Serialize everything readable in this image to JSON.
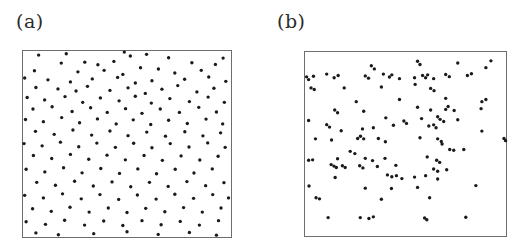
{
  "figure": {
    "width": 523,
    "height": 249,
    "background": "#ffffff",
    "dot_color": "#1a1a1a",
    "frame_color": "#6d6d6d",
    "label_color": "#2b2b2b"
  },
  "panels": [
    {
      "id": "panel-a",
      "label": "(a)",
      "label_x": 16,
      "label_y": 12,
      "box": {
        "x": 22,
        "y": 50,
        "width": 210,
        "height": 188
      }
    },
    {
      "id": "panel-b",
      "label": "(b)",
      "label_x": 277,
      "label_y": 12,
      "box": {
        "x": 304,
        "y": 51,
        "width": 203,
        "height": 186
      }
    }
  ],
  "chart_data": [
    {
      "type": "scatter",
      "title": "(a)",
      "xlabel": "",
      "ylabel": "",
      "xlim": [
        0,
        1
      ],
      "ylim": [
        0,
        1
      ],
      "grid": false,
      "legend": null,
      "marker": {
        "shape": "circle",
        "size_px": 3.4,
        "color": "#1a1a1a"
      },
      "description": "Complete spatial randomness (Poisson) point pattern",
      "n_points": 130,
      "points": [
        [
          0.075,
          0.022
        ],
        [
          0.208,
          0.015
        ],
        [
          0.487,
          0.006
        ],
        [
          0.516,
          0.027
        ],
        [
          0.594,
          0.018
        ],
        [
          0.7,
          0.036
        ],
        [
          0.962,
          0.038
        ],
        [
          0.184,
          0.065
        ],
        [
          0.297,
          0.06
        ],
        [
          0.36,
          0.074
        ],
        [
          0.437,
          0.056
        ],
        [
          0.565,
          0.09
        ],
        [
          0.812,
          0.063
        ],
        [
          0.925,
          0.072
        ],
        [
          0.055,
          0.106
        ],
        [
          0.264,
          0.112
        ],
        [
          0.39,
          0.104
        ],
        [
          0.48,
          0.126
        ],
        [
          0.651,
          0.097
        ],
        [
          0.73,
          0.118
        ],
        [
          0.857,
          0.104
        ],
        [
          0.008,
          0.145
        ],
        [
          0.12,
          0.155
        ],
        [
          0.228,
          0.166
        ],
        [
          0.333,
          0.15
        ],
        [
          0.455,
          0.142
        ],
        [
          0.54,
          0.172
        ],
        [
          0.62,
          0.16
        ],
        [
          0.777,
          0.152
        ],
        [
          0.893,
          0.14
        ],
        [
          0.975,
          0.163
        ],
        [
          0.062,
          0.196
        ],
        [
          0.168,
          0.204
        ],
        [
          0.255,
          0.215
        ],
        [
          0.31,
          0.19
        ],
        [
          0.418,
          0.212
        ],
        [
          0.505,
          0.198
        ],
        [
          0.588,
          0.228
        ],
        [
          0.668,
          0.205
        ],
        [
          0.744,
          0.186
        ],
        [
          0.836,
          0.22
        ],
        [
          0.918,
          0.2
        ],
        [
          0.02,
          0.25
        ],
        [
          0.104,
          0.263
        ],
        [
          0.202,
          0.245
        ],
        [
          0.287,
          0.276
        ],
        [
          0.372,
          0.252
        ],
        [
          0.462,
          0.268
        ],
        [
          0.54,
          0.243
        ],
        [
          0.617,
          0.28
        ],
        [
          0.706,
          0.256
        ],
        [
          0.8,
          0.272
        ],
        [
          0.89,
          0.248
        ],
        [
          0.968,
          0.276
        ],
        [
          0.048,
          0.312
        ],
        [
          0.14,
          0.3
        ],
        [
          0.236,
          0.325
        ],
        [
          0.325,
          0.305
        ],
        [
          0.405,
          0.33
        ],
        [
          0.493,
          0.31
        ],
        [
          0.572,
          0.335
        ],
        [
          0.66,
          0.312
        ],
        [
          0.752,
          0.33
        ],
        [
          0.845,
          0.303
        ],
        [
          0.93,
          0.328
        ],
        [
          0.012,
          0.368
        ],
        [
          0.098,
          0.38
        ],
        [
          0.186,
          0.358
        ],
        [
          0.272,
          0.386
        ],
        [
          0.358,
          0.365
        ],
        [
          0.448,
          0.392
        ],
        [
          0.53,
          0.37
        ],
        [
          0.614,
          0.395
        ],
        [
          0.7,
          0.372
        ],
        [
          0.79,
          0.39
        ],
        [
          0.88,
          0.366
        ],
        [
          0.96,
          0.392
        ],
        [
          0.06,
          0.432
        ],
        [
          0.15,
          0.448
        ],
        [
          0.24,
          0.425
        ],
        [
          0.33,
          0.452
        ],
        [
          0.418,
          0.43
        ],
        [
          0.505,
          0.455
        ],
        [
          0.595,
          0.436
        ],
        [
          0.685,
          0.458
        ],
        [
          0.778,
          0.434
        ],
        [
          0.865,
          0.456
        ],
        [
          0.95,
          0.44
        ],
        [
          0.005,
          0.498
        ],
        [
          0.092,
          0.51
        ],
        [
          0.18,
          0.49
        ],
        [
          0.268,
          0.515
        ],
        [
          0.355,
          0.495
        ],
        [
          0.444,
          0.518
        ],
        [
          0.532,
          0.496
        ],
        [
          0.62,
          0.52
        ],
        [
          0.708,
          0.498
        ],
        [
          0.798,
          0.516
        ],
        [
          0.888,
          0.494
        ],
        [
          0.972,
          0.518
        ],
        [
          0.05,
          0.562
        ],
        [
          0.138,
          0.578
        ],
        [
          0.228,
          0.556
        ],
        [
          0.316,
          0.582
        ],
        [
          0.404,
          0.56
        ],
        [
          0.492,
          0.585
        ],
        [
          0.582,
          0.562
        ],
        [
          0.67,
          0.588
        ],
        [
          0.76,
          0.564
        ],
        [
          0.85,
          0.586
        ],
        [
          0.938,
          0.566
        ],
        [
          0.015,
          0.636
        ],
        [
          0.105,
          0.65
        ],
        [
          0.195,
          0.628
        ],
        [
          0.284,
          0.655
        ],
        [
          0.374,
          0.632
        ],
        [
          0.464,
          0.658
        ],
        [
          0.552,
          0.634
        ],
        [
          0.642,
          0.66
        ],
        [
          0.732,
          0.636
        ],
        [
          0.822,
          0.656
        ],
        [
          0.91,
          0.634
        ],
        [
          0.066,
          0.706
        ],
        [
          0.156,
          0.722
        ],
        [
          0.248,
          0.7
        ],
        [
          0.338,
          0.726
        ],
        [
          0.428,
          0.704
        ],
        [
          0.518,
          0.73
        ],
        [
          0.608,
          0.706
        ],
        [
          0.698,
          0.728
        ],
        [
          0.788,
          0.702
        ],
        [
          0.878,
          0.724
        ],
        [
          0.966,
          0.708
        ],
        [
          0.008,
          0.776
        ],
        [
          0.098,
          0.79
        ],
        [
          0.19,
          0.768
        ],
        [
          0.28,
          0.795
        ],
        [
          0.37,
          0.772
        ],
        [
          0.46,
          0.798
        ],
        [
          0.55,
          0.774
        ],
        [
          0.64,
          0.796
        ],
        [
          0.73,
          0.77
        ],
        [
          0.82,
          0.792
        ],
        [
          0.912,
          0.772
        ],
        [
          0.988,
          0.79
        ],
        [
          0.046,
          0.848
        ],
        [
          0.136,
          0.862
        ],
        [
          0.226,
          0.84
        ],
        [
          0.318,
          0.866
        ],
        [
          0.41,
          0.844
        ],
        [
          0.5,
          0.868
        ],
        [
          0.59,
          0.846
        ],
        [
          0.682,
          0.864
        ],
        [
          0.772,
          0.842
        ],
        [
          0.862,
          0.866
        ],
        [
          0.952,
          0.844
        ],
        [
          0.015,
          0.918
        ],
        [
          0.108,
          0.932
        ],
        [
          0.2,
          0.91
        ],
        [
          0.296,
          0.936
        ],
        [
          0.388,
          0.914
        ],
        [
          0.48,
          0.938
        ],
        [
          0.572,
          0.912
        ],
        [
          0.664,
          0.934
        ],
        [
          0.756,
          0.916
        ],
        [
          0.848,
          0.936
        ],
        [
          0.94,
          0.912
        ],
        [
          0.062,
          0.978
        ],
        [
          0.17,
          0.988
        ],
        [
          0.34,
          0.982
        ],
        [
          0.5,
          0.972
        ],
        [
          0.65,
          0.986
        ],
        [
          0.8,
          0.976
        ],
        [
          0.93,
          0.99
        ]
      ]
    },
    {
      "type": "scatter",
      "title": "(b)",
      "xlabel": "",
      "ylabel": "",
      "xlim": [
        0,
        1
      ],
      "ylim": [
        0,
        1
      ],
      "grid": false,
      "legend": null,
      "marker": {
        "shape": "circle",
        "size_px": 3.4,
        "color": "#1a1a1a"
      },
      "description": "Clustered point pattern with tight pairs and doublets",
      "n_points": 128,
      "points": [
        [
          0.33,
          0.075
        ],
        [
          0.345,
          0.092
        ],
        [
          0.56,
          0.05
        ],
        [
          0.572,
          0.068
        ],
        [
          0.76,
          0.06
        ],
        [
          0.925,
          0.048
        ],
        [
          0.008,
          0.135
        ],
        [
          0.018,
          0.15
        ],
        [
          0.042,
          0.132
        ],
        [
          0.108,
          0.12
        ],
        [
          0.145,
          0.14
        ],
        [
          0.165,
          0.128
        ],
        [
          0.3,
          0.13
        ],
        [
          0.316,
          0.142
        ],
        [
          0.39,
          0.12
        ],
        [
          0.42,
          0.136
        ],
        [
          0.432,
          0.124
        ],
        [
          0.47,
          0.145
        ],
        [
          0.545,
          0.14
        ],
        [
          0.585,
          0.128
        ],
        [
          0.6,
          0.14
        ],
        [
          0.61,
          0.124
        ],
        [
          0.64,
          0.145
        ],
        [
          0.7,
          0.122
        ],
        [
          0.718,
          0.134
        ],
        [
          0.808,
          0.128
        ],
        [
          0.828,
          0.118
        ],
        [
          0.9,
          0.085
        ],
        [
          0.03,
          0.195
        ],
        [
          0.046,
          0.204
        ],
        [
          0.195,
          0.195
        ],
        [
          0.38,
          0.19
        ],
        [
          0.548,
          0.176
        ],
        [
          0.625,
          0.198
        ],
        [
          0.642,
          0.21
        ],
        [
          0.255,
          0.27
        ],
        [
          0.47,
          0.258
        ],
        [
          0.7,
          0.252
        ],
        [
          0.88,
          0.27
        ],
        [
          0.9,
          0.258
        ],
        [
          0.148,
          0.315
        ],
        [
          0.162,
          0.33
        ],
        [
          0.292,
          0.322
        ],
        [
          0.56,
          0.3
        ],
        [
          0.625,
          0.315
        ],
        [
          0.7,
          0.312
        ],
        [
          0.712,
          0.296
        ],
        [
          0.742,
          0.318
        ],
        [
          0.876,
          0.308
        ],
        [
          0.018,
          0.372
        ],
        [
          0.402,
          0.358
        ],
        [
          0.492,
          0.375
        ],
        [
          0.505,
          0.388
        ],
        [
          0.58,
          0.362
        ],
        [
          0.66,
          0.352
        ],
        [
          0.672,
          0.366
        ],
        [
          0.69,
          0.378
        ],
        [
          0.76,
          0.368
        ],
        [
          0.108,
          0.395
        ],
        [
          0.122,
          0.408
        ],
        [
          0.18,
          0.428
        ],
        [
          0.286,
          0.418
        ],
        [
          0.34,
          0.412
        ],
        [
          0.44,
          0.398
        ],
        [
          0.616,
          0.402
        ],
        [
          0.64,
          0.396
        ],
        [
          0.652,
          0.412
        ],
        [
          0.88,
          0.43
        ],
        [
          0.052,
          0.472
        ],
        [
          0.132,
          0.478
        ],
        [
          0.262,
          0.47
        ],
        [
          0.276,
          0.458
        ],
        [
          0.292,
          0.472
        ],
        [
          0.365,
          0.47
        ],
        [
          0.4,
          0.488
        ],
        [
          0.572,
          0.466
        ],
        [
          0.66,
          0.472
        ],
        [
          0.678,
          0.486
        ],
        [
          0.682,
          0.5
        ],
        [
          0.99,
          0.47
        ],
        [
          0.998,
          0.482
        ],
        [
          0.225,
          0.54
        ],
        [
          0.248,
          0.552
        ],
        [
          0.72,
          0.53
        ],
        [
          0.74,
          0.534
        ],
        [
          0.79,
          0.53
        ],
        [
          0.018,
          0.588
        ],
        [
          0.038,
          0.586
        ],
        [
          0.162,
          0.58
        ],
        [
          0.3,
          0.578
        ],
        [
          0.336,
          0.59
        ],
        [
          0.398,
          0.578
        ],
        [
          0.608,
          0.57
        ],
        [
          0.655,
          0.588
        ],
        [
          0.67,
          0.6
        ],
        [
          0.13,
          0.612
        ],
        [
          0.144,
          0.62
        ],
        [
          0.156,
          0.628
        ],
        [
          0.186,
          0.618
        ],
        [
          0.2,
          0.628
        ],
        [
          0.272,
          0.618
        ],
        [
          0.288,
          0.63
        ],
        [
          0.36,
          0.622
        ],
        [
          0.452,
          0.616
        ],
        [
          0.64,
          0.636
        ],
        [
          0.66,
          0.648
        ],
        [
          0.705,
          0.64
        ],
        [
          0.15,
          0.682
        ],
        [
          0.41,
          0.668
        ],
        [
          0.432,
          0.678
        ],
        [
          0.455,
          0.672
        ],
        [
          0.482,
          0.688
        ],
        [
          0.545,
          0.68
        ],
        [
          0.6,
          0.672
        ],
        [
          0.66,
          0.69
        ],
        [
          0.02,
          0.728
        ],
        [
          0.3,
          0.74
        ],
        [
          0.43,
          0.742
        ],
        [
          0.56,
          0.736
        ],
        [
          0.85,
          0.726
        ],
        [
          0.055,
          0.792
        ],
        [
          0.072,
          0.798
        ],
        [
          0.38,
          0.8
        ],
        [
          0.62,
          0.792
        ],
        [
          0.115,
          0.9
        ],
        [
          0.275,
          0.9
        ],
        [
          0.318,
          0.905
        ],
        [
          0.34,
          0.896
        ],
        [
          0.595,
          0.902
        ],
        [
          0.606,
          0.912
        ],
        [
          0.8,
          0.898
        ]
      ]
    }
  ]
}
